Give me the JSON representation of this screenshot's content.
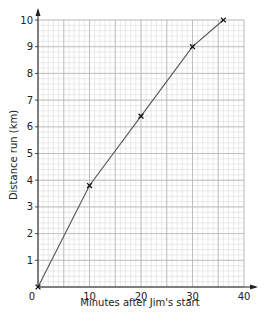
{
  "chart_data": {
    "type": "line",
    "title": "",
    "xlabel": "Minutes after Jim's start",
    "ylabel": "Distance run (km)",
    "xlim": [
      0,
      40
    ],
    "ylim": [
      0,
      10
    ],
    "xticks": [
      0,
      10,
      20,
      30,
      40
    ],
    "yticks": [
      1,
      2,
      3,
      4,
      5,
      6,
      7,
      8,
      9,
      10
    ],
    "grid": true,
    "grid_major": {
      "x_step": 5,
      "y_step": 1
    },
    "grid_minor": {
      "x_step": 1,
      "y_step": 0.2
    },
    "marker": "x",
    "series": [
      {
        "name": "Jim",
        "x": [
          0,
          10,
          20,
          30,
          36
        ],
        "y": [
          0,
          3.8,
          6.4,
          9,
          10
        ]
      }
    ],
    "colors": {
      "line": "#555555",
      "marker": "#111111",
      "grid_minor": "#dcdcdc",
      "grid_major": "#b5b5b5",
      "axis": "#222222"
    }
  }
}
